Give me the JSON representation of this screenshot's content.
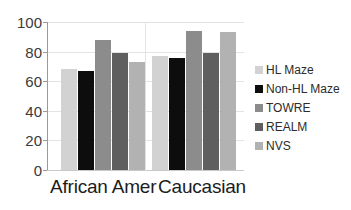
{
  "chart_data": {
    "type": "bar",
    "title": "",
    "subtitle": "",
    "xlabel": "",
    "ylabel": "",
    "categories": [
      "African Amer",
      "Caucasian"
    ],
    "series": [
      {
        "name": "HL Maze",
        "values": [
          68,
          77
        ],
        "color": "#d2d2d2"
      },
      {
        "name": "Non-HL Maze",
        "values": [
          67,
          76
        ],
        "color": "#0d0d0d"
      },
      {
        "name": "TOWRE",
        "values": [
          88,
          94
        ],
        "color": "#8c8c8c"
      },
      {
        "name": "REALM",
        "values": [
          79,
          79
        ],
        "color": "#5f5f5f"
      },
      {
        "name": "NVS",
        "values": [
          73,
          93
        ],
        "color": "#b2b2b2"
      }
    ],
    "ylim": [
      0,
      100
    ],
    "yticks": [
      0,
      20,
      40,
      60,
      80,
      100
    ],
    "ytick_labels": [
      "0",
      "20",
      "40",
      "60",
      "80",
      "100"
    ],
    "grid": true,
    "legend_position": "right"
  },
  "axis": {
    "ytick_labels": [
      "100",
      "80",
      "60",
      "40",
      "20",
      "0"
    ]
  },
  "legend": {
    "entries": [
      {
        "label": "HL Maze"
      },
      {
        "label": "Non-HL Maze"
      },
      {
        "label": "TOWRE"
      },
      {
        "label": "REALM"
      },
      {
        "label": "NVS"
      }
    ]
  }
}
